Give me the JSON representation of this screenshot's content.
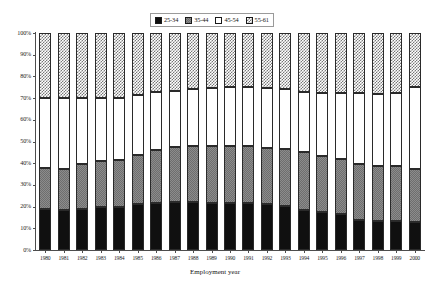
{
  "chart": {
    "type": "stacked-bar-percent",
    "xlabel": "Employment year",
    "ylabel": "",
    "title": "",
    "ylim": [
      0,
      100
    ],
    "yticks": [
      "0%",
      "10%",
      "20%",
      "30%",
      "40%",
      "50%",
      "60%",
      "70%",
      "80%",
      "90%",
      "100%"
    ],
    "legend_position": "top-center"
  },
  "legend": {
    "entries": [
      {
        "label": "25-34",
        "pattern": "solid-black",
        "color": "#101010"
      },
      {
        "label": "35-44",
        "pattern": "gray-checker",
        "color": "#8c8c8c"
      },
      {
        "label": "45-54",
        "pattern": "white-empty",
        "color": "#ffffff"
      },
      {
        "label": "55-61",
        "pattern": "diagonal-hatch",
        "color": "#777777"
      }
    ]
  },
  "chart_data": {
    "type": "bar",
    "title": "",
    "xlabel": "Employment year",
    "ylabel": "",
    "ylim": [
      0,
      100
    ],
    "stacked": true,
    "normalized_percent": true,
    "grid": false,
    "legend_position": "top-center",
    "categories": [
      "1980",
      "1981",
      "1982",
      "1983",
      "1984",
      "1985",
      "1986",
      "1987",
      "1988",
      "1989",
      "1990",
      "1991",
      "1992",
      "1993",
      "1994",
      "1995",
      "1996",
      "1997",
      "1998",
      "1999",
      "2000"
    ],
    "series": [
      {
        "name": "25-34",
        "pattern": "solid-black",
        "values": [
          19,
          18.5,
          19,
          20,
          20,
          21,
          21.5,
          22,
          22,
          21.5,
          21.5,
          21.5,
          21,
          20.5,
          18.5,
          17.5,
          16.5,
          14,
          13.5,
          13.5,
          13
        ]
      },
      {
        "name": "35-44",
        "pattern": "gray-checker",
        "values": [
          19,
          19,
          20.5,
          21,
          21.5,
          23,
          24.5,
          25.5,
          26,
          26.5,
          26.5,
          26.5,
          26,
          26,
          26.5,
          26,
          25.5,
          25.5,
          25,
          25,
          24.5
        ]
      },
      {
        "name": "45-54",
        "pattern": "white-empty",
        "values": [
          32,
          32.5,
          30.5,
          29,
          28.5,
          27.5,
          27,
          26,
          26,
          26.5,
          27,
          27,
          27.5,
          27.5,
          28,
          29,
          30.5,
          33,
          33.5,
          34,
          37.5
        ]
      },
      {
        "name": "55-61",
        "pattern": "diagonal-hatch",
        "values": [
          30,
          30,
          30,
          30,
          30,
          28.5,
          27,
          26.5,
          26,
          25.5,
          25,
          25,
          25.5,
          26,
          27,
          27.5,
          27.5,
          27.5,
          28,
          27.5,
          25
        ]
      }
    ],
    "cumulative_tops": {
      "25-34": [
        19,
        18.5,
        19,
        20,
        20,
        21,
        21.5,
        22,
        22,
        21.5,
        21.5,
        21.5,
        21,
        20.5,
        18.5,
        17.5,
        16.5,
        14,
        13.5,
        13.5,
        13
      ],
      "35-44": [
        38,
        37.5,
        39.5,
        41,
        41.5,
        44,
        46,
        47.5,
        48,
        48,
        48,
        48,
        47,
        46.5,
        45,
        43.5,
        42,
        39.5,
        38.5,
        38.5,
        37.5
      ],
      "45-54": [
        70,
        70,
        70,
        70,
        70,
        71.5,
        73,
        73.5,
        74,
        74.5,
        75,
        75,
        74.5,
        74,
        73,
        72.5,
        72.5,
        72.5,
        72,
        72.5,
        75
      ],
      "55-61": [
        100,
        100,
        100,
        100,
        100,
        100,
        100,
        100,
        100,
        100,
        100,
        100,
        100,
        100,
        100,
        100,
        100,
        100,
        100,
        100,
        100
      ]
    }
  }
}
